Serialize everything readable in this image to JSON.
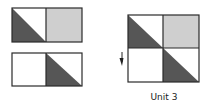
{
  "colors": {
    "outline": "#2a2a2a",
    "dark_fill": "#565656",
    "light_fill": "#cfcfcf",
    "white_fill": "#ffffff"
  },
  "pieces": [
    {
      "name": "top-piece",
      "cells": [
        {
          "fill": "half-dark-lower-left"
        },
        {
          "fill": "light"
        }
      ]
    },
    {
      "name": "bottom-piece",
      "cells": [
        {
          "fill": "white"
        },
        {
          "fill": "half-dark-lower-left"
        }
      ]
    }
  ],
  "unit": {
    "label": "Unit 3",
    "grid": [
      [
        "half-dark-lower-left",
        "light"
      ],
      [
        "white",
        "half-dark-lower-left"
      ]
    ]
  },
  "arrow": {
    "direction": "down"
  }
}
